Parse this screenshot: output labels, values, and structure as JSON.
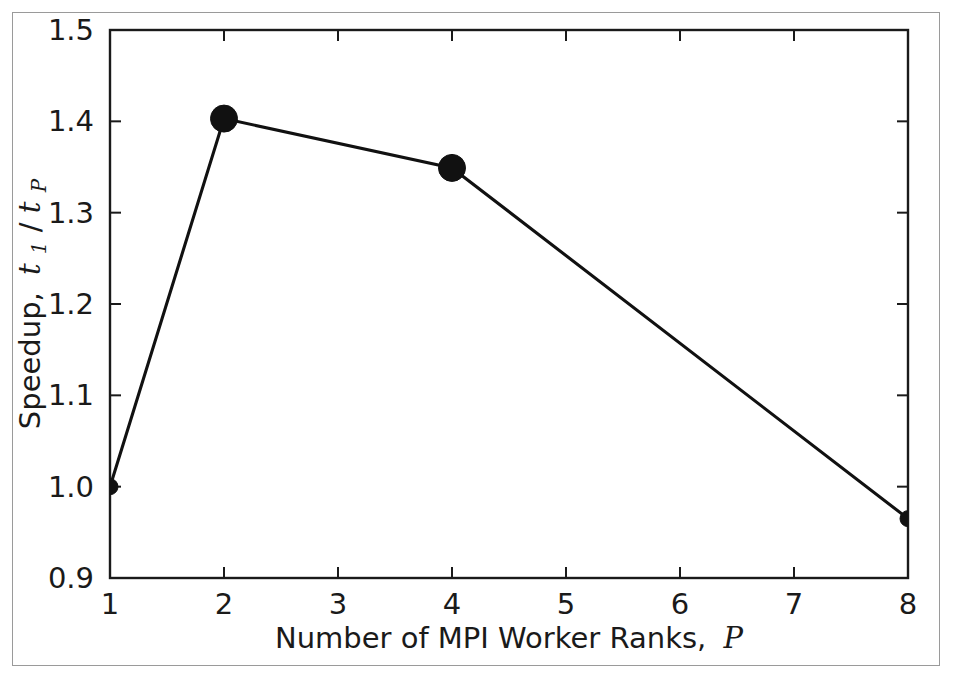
{
  "figure": {
    "border_color": "#9a9a9a",
    "background": "#ffffff"
  },
  "chart_data": {
    "type": "line",
    "title": "",
    "subtitle": "",
    "xlabel": "Number of MPI Worker Ranks, P",
    "xlabel_text": "Number of MPI Worker Ranks,",
    "xlabel_var": "P",
    "ylabel": "Speedup, t1/tP",
    "ylabel_text": "Speedup,",
    "ylabel_var_num": "t",
    "ylabel_sub_num": "1",
    "ylabel_slash": "/",
    "ylabel_var_den": "t",
    "ylabel_sub_den": "P",
    "x": [
      1,
      2,
      4,
      8
    ],
    "values": [
      1.0,
      1.403,
      1.349,
      0.965
    ],
    "series": [
      {
        "name": "speedup",
        "x": [
          1,
          2,
          4,
          8
        ],
        "values": [
          1.0,
          1.403,
          1.349,
          0.965
        ],
        "color": "#111111",
        "marker": "circle"
      }
    ],
    "xlim": [
      1,
      8
    ],
    "ylim": [
      0.9,
      1.5
    ],
    "xticks": [
      1,
      2,
      3,
      4,
      5,
      6,
      7,
      8
    ],
    "xticklabels": [
      "1",
      "2",
      "3",
      "4",
      "5",
      "6",
      "7",
      "8"
    ],
    "yticks": [
      0.9,
      1.0,
      1.1,
      1.2,
      1.3,
      1.4,
      1.5
    ],
    "yticklabels": [
      "0.9",
      "1.0",
      "1.1",
      "1.2",
      "1.3",
      "1.4",
      "1.5"
    ],
    "grid": false,
    "legend": false,
    "legend_position": "none",
    "line_color": "#111111",
    "axis_color": "#1a1a1a"
  }
}
